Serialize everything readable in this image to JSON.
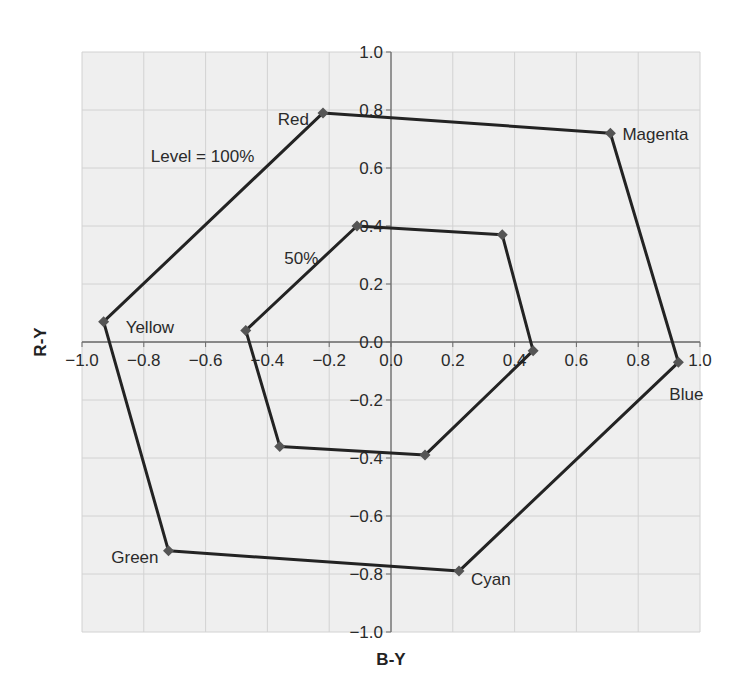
{
  "chart_data": {
    "type": "line",
    "title": "",
    "xlabel": "B-Y",
    "ylabel": "R-Y",
    "xlim": [
      -1.0,
      1.0
    ],
    "ylim": [
      -1.0,
      1.0
    ],
    "grid": true,
    "legend": "none",
    "x_ticks": [
      "−1.0",
      "−0.8",
      "−0.6",
      "−0.4",
      "−0.2",
      "0.0",
      "0.2",
      "0.4",
      "0.6",
      "0.8",
      "1.0"
    ],
    "y_ticks": [
      "−1.0",
      "−0.8",
      "−0.6",
      "−0.4",
      "−0.2",
      "0.0",
      "0.2",
      "0.4",
      "0.6",
      "0.8",
      "1.0"
    ],
    "series": [
      {
        "name": "Level = 100%",
        "closed": true,
        "points": [
          {
            "label": "Red",
            "x": -0.22,
            "y": 0.79
          },
          {
            "label": "Magenta",
            "x": 0.71,
            "y": 0.72
          },
          {
            "label": "Blue",
            "x": 0.93,
            "y": -0.07
          },
          {
            "label": "Cyan",
            "x": 0.22,
            "y": -0.79
          },
          {
            "label": "Green",
            "x": -0.72,
            "y": -0.72
          },
          {
            "label": "Yellow",
            "x": -0.93,
            "y": 0.07
          }
        ]
      },
      {
        "name": "50%",
        "closed": true,
        "points": [
          {
            "label": "Red",
            "x": -0.11,
            "y": 0.4
          },
          {
            "label": "Magenta",
            "x": 0.36,
            "y": 0.37
          },
          {
            "label": "Blue",
            "x": 0.46,
            "y": -0.03
          },
          {
            "label": "Cyan",
            "x": 0.11,
            "y": -0.39
          },
          {
            "label": "Green",
            "x": -0.36,
            "y": -0.36
          },
          {
            "label": "Yellow",
            "x": -0.47,
            "y": 0.04
          }
        ]
      }
    ],
    "annotations": [
      {
        "text": "Red",
        "x": -0.22,
        "y": 0.79,
        "anchor": "end",
        "dx": -14,
        "dy": 6
      },
      {
        "text": "Magenta",
        "x": 0.71,
        "y": 0.72,
        "anchor": "start",
        "dx": 12,
        "dy": 1
      },
      {
        "text": "Blue",
        "x": 0.93,
        "y": -0.07,
        "anchor": "middle",
        "dx": 8,
        "dy": 32
      },
      {
        "text": "Cyan",
        "x": 0.22,
        "y": -0.79,
        "anchor": "start",
        "dx": 12,
        "dy": 8
      },
      {
        "text": "Green",
        "x": -0.72,
        "y": -0.72,
        "anchor": "end",
        "dx": -10,
        "dy": 6
      },
      {
        "text": "Yellow",
        "x": -0.93,
        "y": 0.07,
        "anchor": "start",
        "dx": 22,
        "dy": 5
      },
      {
        "text": "Level = 100%",
        "x": -0.61,
        "y": 0.64,
        "anchor": "middle",
        "dx": 0,
        "dy": 0
      },
      {
        "text": "50%",
        "x": -0.29,
        "y": 0.29,
        "anchor": "middle",
        "dx": 0,
        "dy": 0
      }
    ]
  },
  "colors": {
    "plot_background": "#efefef",
    "grid": "#d2d2d2",
    "axis": "#6a6a6a",
    "line": "#232323",
    "marker": "#555555",
    "text": "#2a2a2a"
  }
}
